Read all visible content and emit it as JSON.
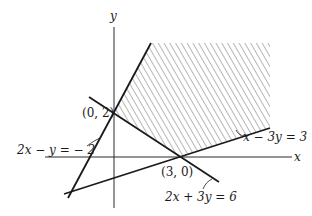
{
  "diagram": {
    "type": "linear-inequalities-feasible-region",
    "axes": {
      "x_label": "x",
      "y_label": "y"
    },
    "lines": [
      {
        "equation": "2x − y = − 2",
        "lhs": "2x − y = − 2"
      },
      {
        "equation": "x − 3y = 3",
        "lhs": "x − 3y = 3"
      },
      {
        "equation": "2x + 3y = 6",
        "lhs": "2x + 3y = 6"
      }
    ],
    "points": [
      {
        "label": "(0, 2)"
      },
      {
        "label": "(3, 0)"
      }
    ],
    "region": "hatched unbounded region above x − 3y = 3 and right of 2x − y = −2",
    "colors": {
      "line": "#1a1a1a",
      "hatch": "#777777",
      "background": "#ffffff"
    }
  }
}
